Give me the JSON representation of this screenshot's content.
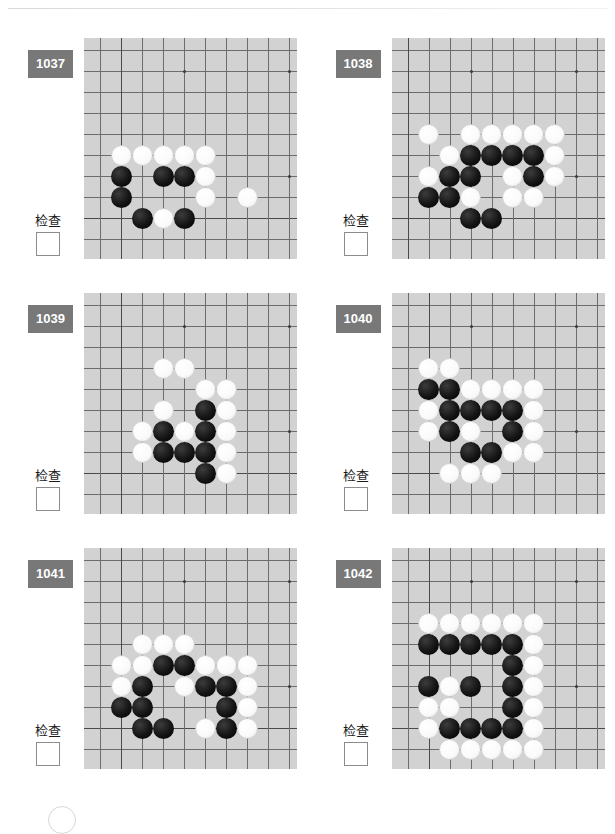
{
  "page": {
    "check_label": "检查",
    "badge_color": "#787878",
    "board_color": "#d2d2d2",
    "line_color": "#6d6d6d"
  },
  "board_spec": {
    "cols": 10,
    "rows": 10,
    "spacing": 21,
    "origin_x": 16,
    "origin_y": 12,
    "note": "grid indices: col 0 = leftmost board edge line, row 9 = bottom board edge line"
  },
  "problems": [
    {
      "number": "1037",
      "check_label": "检查",
      "hoshi": [
        [
          4,
          1
        ],
        [
          9,
          1
        ],
        [
          9,
          6
        ]
      ],
      "edges": {
        "left": 1,
        "bottom": 8
      },
      "stones": [
        {
          "color": "w",
          "col": 1,
          "row": 5
        },
        {
          "color": "w",
          "col": 2,
          "row": 5
        },
        {
          "color": "w",
          "col": 3,
          "row": 5
        },
        {
          "color": "w",
          "col": 4,
          "row": 5
        },
        {
          "color": "w",
          "col": 5,
          "row": 5
        },
        {
          "color": "b",
          "col": 1,
          "row": 6
        },
        {
          "color": "b",
          "col": 3,
          "row": 6
        },
        {
          "color": "b",
          "col": 4,
          "row": 6
        },
        {
          "color": "w",
          "col": 5,
          "row": 6
        },
        {
          "color": "b",
          "col": 1,
          "row": 7
        },
        {
          "color": "w",
          "col": 5,
          "row": 7
        },
        {
          "color": "w",
          "col": 7,
          "row": 7
        },
        {
          "color": "b",
          "col": 2,
          "row": 8
        },
        {
          "color": "w",
          "col": 3,
          "row": 8
        },
        {
          "color": "b",
          "col": 4,
          "row": 8
        }
      ]
    },
    {
      "number": "1038",
      "check_label": "检查",
      "hoshi": [
        [
          3,
          1
        ],
        [
          8,
          1
        ],
        [
          8,
          6
        ]
      ],
      "edges": {
        "left": 0,
        "bottom": 8
      },
      "stones": [
        {
          "color": "w",
          "col": 1,
          "row": 4
        },
        {
          "color": "w",
          "col": 3,
          "row": 4
        },
        {
          "color": "w",
          "col": 4,
          "row": 4
        },
        {
          "color": "w",
          "col": 5,
          "row": 4
        },
        {
          "color": "w",
          "col": 6,
          "row": 4
        },
        {
          "color": "w",
          "col": 7,
          "row": 4
        },
        {
          "color": "w",
          "col": 2,
          "row": 5
        },
        {
          "color": "b",
          "col": 3,
          "row": 5
        },
        {
          "color": "b",
          "col": 4,
          "row": 5
        },
        {
          "color": "b",
          "col": 5,
          "row": 5
        },
        {
          "color": "b",
          "col": 6,
          "row": 5
        },
        {
          "color": "w",
          "col": 7,
          "row": 5
        },
        {
          "color": "w",
          "col": 1,
          "row": 6
        },
        {
          "color": "b",
          "col": 2,
          "row": 6
        },
        {
          "color": "b",
          "col": 3,
          "row": 6
        },
        {
          "color": "w",
          "col": 5,
          "row": 6
        },
        {
          "color": "b",
          "col": 6,
          "row": 6
        },
        {
          "color": "w",
          "col": 7,
          "row": 6
        },
        {
          "color": "b",
          "col": 1,
          "row": 7
        },
        {
          "color": "b",
          "col": 2,
          "row": 7
        },
        {
          "color": "w",
          "col": 3,
          "row": 7
        },
        {
          "color": "w",
          "col": 5,
          "row": 7
        },
        {
          "color": "w",
          "col": 6,
          "row": 7
        },
        {
          "color": "b",
          "col": 3,
          "row": 8
        },
        {
          "color": "b",
          "col": 4,
          "row": 8
        }
      ]
    },
    {
      "number": "1039",
      "check_label": "检查",
      "hoshi": [
        [
          4,
          1
        ],
        [
          9,
          1
        ],
        [
          9,
          6
        ]
      ],
      "edges": {
        "left": 1,
        "bottom": 8
      },
      "stones": [
        {
          "color": "w",
          "col": 3,
          "row": 3
        },
        {
          "color": "w",
          "col": 4,
          "row": 3
        },
        {
          "color": "w",
          "col": 5,
          "row": 4
        },
        {
          "color": "w",
          "col": 6,
          "row": 4
        },
        {
          "color": "w",
          "col": 3,
          "row": 5
        },
        {
          "color": "b",
          "col": 5,
          "row": 5
        },
        {
          "color": "w",
          "col": 6,
          "row": 5
        },
        {
          "color": "w",
          "col": 2,
          "row": 6
        },
        {
          "color": "b",
          "col": 3,
          "row": 6
        },
        {
          "color": "w",
          "col": 4,
          "row": 6
        },
        {
          "color": "b",
          "col": 5,
          "row": 6
        },
        {
          "color": "w",
          "col": 6,
          "row": 6
        },
        {
          "color": "w",
          "col": 2,
          "row": 7
        },
        {
          "color": "b",
          "col": 3,
          "row": 7
        },
        {
          "color": "b",
          "col": 4,
          "row": 7
        },
        {
          "color": "b",
          "col": 5,
          "row": 7
        },
        {
          "color": "w",
          "col": 6,
          "row": 7
        },
        {
          "color": "b",
          "col": 5,
          "row": 8
        },
        {
          "color": "w",
          "col": 6,
          "row": 8
        }
      ]
    },
    {
      "number": "1040",
      "check_label": "检查",
      "hoshi": [
        [
          3,
          1
        ],
        [
          8,
          1
        ],
        [
          8,
          6
        ]
      ],
      "edges": {
        "left": 1,
        "bottom": 8
      },
      "stones": [
        {
          "color": "w",
          "col": 1,
          "row": 3
        },
        {
          "color": "w",
          "col": 2,
          "row": 3
        },
        {
          "color": "b",
          "col": 1,
          "row": 4
        },
        {
          "color": "b",
          "col": 2,
          "row": 4
        },
        {
          "color": "w",
          "col": 3,
          "row": 4
        },
        {
          "color": "w",
          "col": 4,
          "row": 4
        },
        {
          "color": "w",
          "col": 5,
          "row": 4
        },
        {
          "color": "w",
          "col": 6,
          "row": 4
        },
        {
          "color": "w",
          "col": 1,
          "row": 5
        },
        {
          "color": "b",
          "col": 2,
          "row": 5
        },
        {
          "color": "b",
          "col": 3,
          "row": 5
        },
        {
          "color": "b",
          "col": 4,
          "row": 5
        },
        {
          "color": "b",
          "col": 5,
          "row": 5
        },
        {
          "color": "w",
          "col": 6,
          "row": 5
        },
        {
          "color": "w",
          "col": 1,
          "row": 6
        },
        {
          "color": "b",
          "col": 2,
          "row": 6
        },
        {
          "color": "w",
          "col": 3,
          "row": 6
        },
        {
          "color": "b",
          "col": 5,
          "row": 6
        },
        {
          "color": "w",
          "col": 6,
          "row": 6
        },
        {
          "color": "b",
          "col": 3,
          "row": 7
        },
        {
          "color": "b",
          "col": 4,
          "row": 7
        },
        {
          "color": "w",
          "col": 5,
          "row": 7
        },
        {
          "color": "w",
          "col": 6,
          "row": 7
        },
        {
          "color": "w",
          "col": 2,
          "row": 8
        },
        {
          "color": "w",
          "col": 3,
          "row": 8
        },
        {
          "color": "w",
          "col": 4,
          "row": 8
        }
      ]
    },
    {
      "number": "1041",
      "check_label": "检查",
      "hoshi": [
        [
          4,
          1
        ],
        [
          9,
          1
        ],
        [
          9,
          6
        ]
      ],
      "edges": {
        "left": 1,
        "bottom": 8
      },
      "stones": [
        {
          "color": "w",
          "col": 2,
          "row": 4
        },
        {
          "color": "w",
          "col": 3,
          "row": 4
        },
        {
          "color": "w",
          "col": 4,
          "row": 4
        },
        {
          "color": "w",
          "col": 1,
          "row": 5
        },
        {
          "color": "w",
          "col": 2,
          "row": 5
        },
        {
          "color": "b",
          "col": 3,
          "row": 5
        },
        {
          "color": "b",
          "col": 4,
          "row": 5
        },
        {
          "color": "w",
          "col": 5,
          "row": 5
        },
        {
          "color": "w",
          "col": 6,
          "row": 5
        },
        {
          "color": "w",
          "col": 7,
          "row": 5
        },
        {
          "color": "w",
          "col": 1,
          "row": 6
        },
        {
          "color": "b",
          "col": 2,
          "row": 6
        },
        {
          "color": "w",
          "col": 4,
          "row": 6
        },
        {
          "color": "b",
          "col": 5,
          "row": 6
        },
        {
          "color": "b",
          "col": 6,
          "row": 6
        },
        {
          "color": "w",
          "col": 7,
          "row": 6
        },
        {
          "color": "b",
          "col": 1,
          "row": 7
        },
        {
          "color": "b",
          "col": 2,
          "row": 7
        },
        {
          "color": "b",
          "col": 6,
          "row": 7
        },
        {
          "color": "w",
          "col": 7,
          "row": 7
        },
        {
          "color": "b",
          "col": 2,
          "row": 8
        },
        {
          "color": "b",
          "col": 3,
          "row": 8
        },
        {
          "color": "w",
          "col": 5,
          "row": 8
        },
        {
          "color": "b",
          "col": 6,
          "row": 8
        },
        {
          "color": "w",
          "col": 7,
          "row": 8
        }
      ]
    },
    {
      "number": "1042",
      "check_label": "检查",
      "hoshi": [
        [
          3,
          1
        ],
        [
          8,
          1
        ],
        [
          8,
          6
        ]
      ],
      "edges": {
        "left": 1,
        "bottom": 8
      },
      "stones": [
        {
          "color": "w",
          "col": 1,
          "row": 3
        },
        {
          "color": "w",
          "col": 2,
          "row": 3
        },
        {
          "color": "w",
          "col": 3,
          "row": 3
        },
        {
          "color": "w",
          "col": 4,
          "row": 3
        },
        {
          "color": "w",
          "col": 5,
          "row": 3
        },
        {
          "color": "w",
          "col": 6,
          "row": 3
        },
        {
          "color": "b",
          "col": 1,
          "row": 4
        },
        {
          "color": "b",
          "col": 2,
          "row": 4
        },
        {
          "color": "b",
          "col": 3,
          "row": 4
        },
        {
          "color": "b",
          "col": 4,
          "row": 4
        },
        {
          "color": "b",
          "col": 5,
          "row": 4
        },
        {
          "color": "w",
          "col": 6,
          "row": 4
        },
        {
          "color": "b",
          "col": 5,
          "row": 5
        },
        {
          "color": "w",
          "col": 6,
          "row": 5
        },
        {
          "color": "b",
          "col": 1,
          "row": 6
        },
        {
          "color": "w",
          "col": 2,
          "row": 6
        },
        {
          "color": "b",
          "col": 3,
          "row": 6
        },
        {
          "color": "b",
          "col": 5,
          "row": 6
        },
        {
          "color": "w",
          "col": 6,
          "row": 6
        },
        {
          "color": "w",
          "col": 1,
          "row": 7
        },
        {
          "color": "w",
          "col": 2,
          "row": 7
        },
        {
          "color": "b",
          "col": 5,
          "row": 7
        },
        {
          "color": "w",
          "col": 6,
          "row": 7
        },
        {
          "color": "w",
          "col": 1,
          "row": 8
        },
        {
          "color": "b",
          "col": 2,
          "row": 8
        },
        {
          "color": "b",
          "col": 3,
          "row": 8
        },
        {
          "color": "b",
          "col": 4,
          "row": 8
        },
        {
          "color": "b",
          "col": 5,
          "row": 8
        },
        {
          "color": "w",
          "col": 6,
          "row": 8
        },
        {
          "color": "w",
          "col": 2,
          "row": 9
        },
        {
          "color": "w",
          "col": 3,
          "row": 9
        },
        {
          "color": "w",
          "col": 4,
          "row": 9
        },
        {
          "color": "w",
          "col": 5,
          "row": 9
        },
        {
          "color": "w",
          "col": 6,
          "row": 9
        }
      ]
    }
  ]
}
